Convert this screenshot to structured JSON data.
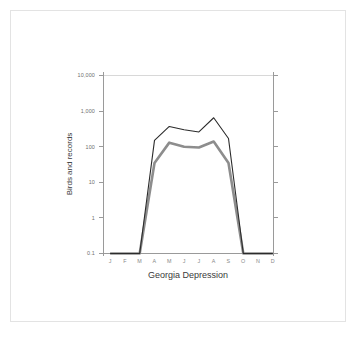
{
  "figure": {
    "frame_border_color": "#e3e3e3",
    "background_color": "#ffffff"
  },
  "chart_data": {
    "type": "line",
    "title": "",
    "subtitle": "",
    "xlabel": "Georgia Depression",
    "ylabel": "Birds and records",
    "yscale": "log",
    "ylim": [
      0.1,
      10000
    ],
    "ytick_labels": [
      "10,000",
      "1,000",
      "100",
      "10",
      "1",
      "0.1"
    ],
    "ytick_values": [
      10000,
      1000,
      100,
      10,
      1,
      0.1
    ],
    "categories": [
      "J",
      "F",
      "M",
      "A",
      "M",
      "J",
      "J",
      "A",
      "S",
      "O",
      "N",
      "D"
    ],
    "x_tick_labels": [
      "J",
      "F",
      "M",
      "A",
      "M",
      "J",
      "J",
      "A",
      "S",
      "O",
      "N",
      "D"
    ],
    "grid": "single horizontal gridline at 10,000",
    "legend": "none",
    "right_axis_ticks": true,
    "series": [
      {
        "name": "records",
        "color": "#2b2b2b",
        "style": "thin line",
        "values": [
          0.1,
          0.1,
          0.1,
          150,
          370,
          300,
          260,
          650,
          170,
          0.1,
          0.1,
          0.1
        ]
      },
      {
        "name": "birds",
        "color": "#8d8d8d",
        "style": "thick line",
        "values": [
          0.1,
          0.1,
          0.1,
          35,
          130,
          100,
          95,
          140,
          35,
          0.1,
          0.1,
          0.1
        ]
      }
    ]
  }
}
